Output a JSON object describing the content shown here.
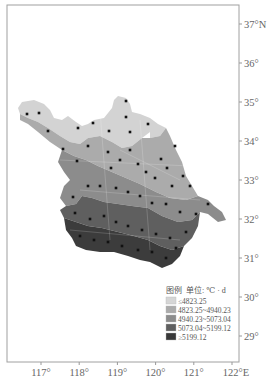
{
  "map": {
    "x_axis": {
      "ticks": [
        {
          "value": 117,
          "label": "117°"
        },
        {
          "value": 118,
          "label": "118°"
        },
        {
          "value": 119,
          "label": "119°"
        },
        {
          "value": 120,
          "label": "120°"
        },
        {
          "value": 121,
          "label": "121°"
        },
        {
          "value": 122,
          "label": "122°E"
        }
      ]
    },
    "y_axis": {
      "ticks": [
        {
          "value": 37,
          "label": "37°N"
        },
        {
          "value": 36,
          "label": "36°"
        },
        {
          "value": 35,
          "label": "35°"
        },
        {
          "value": 34,
          "label": "34°"
        },
        {
          "value": 33,
          "label": "33°"
        },
        {
          "value": 32,
          "label": "32°"
        },
        {
          "value": 31,
          "label": "31°"
        },
        {
          "value": 30,
          "label": "30°"
        },
        {
          "value": 29,
          "label": "29°"
        }
      ]
    },
    "legend": {
      "title": "图例",
      "unit_label": "单位: ℃ · d",
      "classes": [
        {
          "label": "≤4823.25",
          "color": "#d6d6d6"
        },
        {
          "label": "4823.25~4940.23",
          "color": "#ababab"
        },
        {
          "label": "4940.23~5073.04",
          "color": "#8c8c8c"
        },
        {
          "label": "5073.04~5199.12",
          "color": "#5f5f5f"
        },
        {
          "label": "≥5199.12",
          "color": "#383838"
        }
      ]
    },
    "colors": {
      "frame": "#999999",
      "station": "#111111"
    }
  }
}
